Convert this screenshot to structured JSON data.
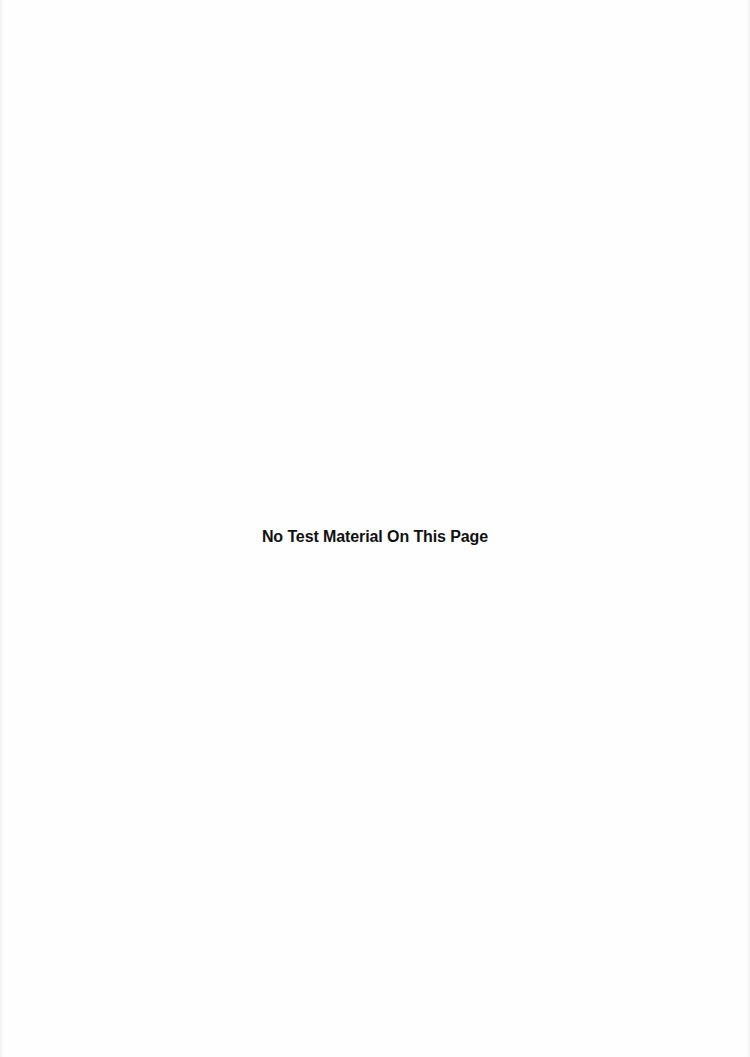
{
  "page": {
    "notice_text": "No Test Material On This Page"
  }
}
